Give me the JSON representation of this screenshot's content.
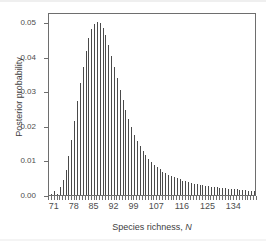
{
  "chart_data": {
    "type": "bar",
    "title": "",
    "subtitle": "",
    "xlabel": "Species richness, N",
    "xlabel_plain": "Species richness, ",
    "xlabel_italic": "N",
    "ylabel": "Posterior probability",
    "xlim": [
      69,
      142
    ],
    "ylim": [
      0,
      0.053
    ],
    "grid": false,
    "legend": null,
    "bar_color": "#4a4a4a",
    "frame_color": "#6e6e6e",
    "background": "#ffffff",
    "x_tick_labels": [
      "71",
      "78",
      "85",
      "92",
      "99",
      "107",
      "116",
      "125",
      "134"
    ],
    "x_tick_values": [
      71,
      78,
      85,
      92,
      99,
      107,
      116,
      125,
      134
    ],
    "y_tick_labels": [
      "0.00",
      "0.01",
      "0.02",
      "0.03",
      "0.04",
      "0.05"
    ],
    "y_tick_values": [
      0.0,
      0.01,
      0.02,
      0.03,
      0.04,
      0.05
    ],
    "x": [
      70,
      71,
      72,
      73,
      74,
      75,
      76,
      77,
      78,
      79,
      80,
      81,
      82,
      83,
      84,
      85,
      86,
      87,
      88,
      89,
      90,
      91,
      92,
      93,
      94,
      95,
      96,
      97,
      98,
      99,
      100,
      101,
      102,
      103,
      104,
      105,
      106,
      107,
      108,
      109,
      110,
      111,
      112,
      113,
      114,
      115,
      116,
      117,
      118,
      119,
      120,
      121,
      122,
      123,
      124,
      125,
      126,
      127,
      128,
      129,
      130,
      131,
      132,
      133,
      134,
      135,
      136,
      137,
      138,
      139,
      140,
      141
    ],
    "values": [
      0.0002,
      0.0012,
      0.0004,
      0.0022,
      0.0043,
      0.0072,
      0.0112,
      0.016,
      0.0215,
      0.0272,
      0.0325,
      0.0371,
      0.0418,
      0.0455,
      0.048,
      0.0495,
      0.0501,
      0.0497,
      0.0483,
      0.0462,
      0.0435,
      0.0404,
      0.0371,
      0.0338,
      0.0305,
      0.0274,
      0.0245,
      0.0219,
      0.0196,
      0.0175,
      0.0157,
      0.0141,
      0.0127,
      0.0115,
      0.0104,
      0.0095,
      0.0087,
      0.008,
      0.0074,
      0.0068,
      0.0063,
      0.0059,
      0.0055,
      0.0051,
      0.0048,
      0.0045,
      0.0042,
      0.004,
      0.0037,
      0.0035,
      0.0033,
      0.0031,
      0.003,
      0.0028,
      0.0027,
      0.0025,
      0.0024,
      0.0023,
      0.0022,
      0.0021,
      0.002,
      0.0019,
      0.0018,
      0.0017,
      0.0016,
      0.0016,
      0.0015,
      0.0014,
      0.0014,
      0.0013,
      0.0012,
      0.0012
    ]
  }
}
